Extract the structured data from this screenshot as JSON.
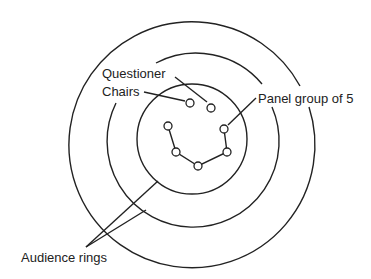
{
  "diagram": {
    "labels": {
      "questioner": "Questioner",
      "chairs": "Chairs",
      "panel": "Panel group of 5",
      "audience": "Audience rings"
    },
    "colors": {
      "stroke": "#222222",
      "background": "#ffffff"
    },
    "rings": [
      {
        "name": "outer-audience-ring",
        "cx": 188,
        "cy": 140,
        "r": 123
      },
      {
        "name": "middle-audience-ring",
        "cx": 191,
        "cy": 144,
        "r": 86
      },
      {
        "name": "inner-panel-ring",
        "cx": 192,
        "cy": 139,
        "r": 55
      }
    ],
    "chairs": [
      {
        "name": "questioner-chair-1",
        "x": 190,
        "y": 103
      },
      {
        "name": "questioner-chair-2",
        "x": 211,
        "y": 108
      }
    ],
    "panel_seats": [
      {
        "x": 168,
        "y": 126
      },
      {
        "x": 176,
        "y": 152
      },
      {
        "x": 198,
        "y": 166
      },
      {
        "x": 227,
        "y": 152
      },
      {
        "x": 224,
        "y": 129
      }
    ]
  }
}
